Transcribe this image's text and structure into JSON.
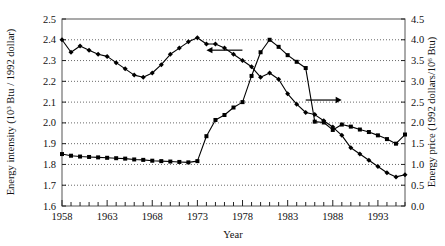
{
  "chart_data": {
    "type": "line",
    "title": "",
    "xlabel": "Year",
    "ylabel": "Energy intensity (10^3 Btu / 1992 dollar)",
    "y2label": "Energy price (1992 dollars/10^6 Btu)",
    "xlim": [
      1958,
      1996
    ],
    "ylim": [
      1.6,
      2.5
    ],
    "y2lim": [
      0.0,
      4.5
    ],
    "grid": true,
    "legend": "none",
    "x_tick_labels": [
      "1958",
      "1963",
      "1968",
      "1973",
      "1978",
      "1983",
      "1988",
      "1993"
    ],
    "x_tick_values": [
      1958,
      1963,
      1968,
      1973,
      1978,
      1983,
      1988,
      1993
    ],
    "x_minor_tick_step": 1,
    "y_tick_labels": [
      "1.6",
      "1.7",
      "1.8",
      "1.9",
      "2.0",
      "2.1",
      "2.2",
      "2.3",
      "2.4",
      "2.5"
    ],
    "y_tick_values": [
      1.6,
      1.7,
      1.8,
      1.9,
      2.0,
      2.1,
      2.2,
      2.3,
      2.4,
      2.5
    ],
    "y2_tick_labels": [
      "0.0",
      "0.5",
      "1.0",
      "1.5",
      "2.0",
      "2.5",
      "3.0",
      "3.5",
      "4.0",
      "4.5"
    ],
    "y2_tick_values": [
      0.0,
      0.5,
      1.0,
      1.5,
      2.0,
      2.5,
      3.0,
      3.5,
      4.0,
      4.5
    ],
    "x": [
      1958,
      1959,
      1960,
      1961,
      1962,
      1963,
      1964,
      1965,
      1966,
      1967,
      1968,
      1969,
      1970,
      1971,
      1972,
      1973,
      1974,
      1975,
      1976,
      1977,
      1978,
      1979,
      1980,
      1981,
      1982,
      1983,
      1984,
      1985,
      1986,
      1987,
      1988,
      1989,
      1990,
      1991,
      1992,
      1993,
      1994,
      1995,
      1996
    ],
    "series": [
      {
        "name": "Energy intensity",
        "axis": "left",
        "units": "10^3 Btu / 1992 dollar",
        "marker": "filled-diamond",
        "color": "#000000",
        "values": [
          2.4,
          2.34,
          2.37,
          2.35,
          2.33,
          2.32,
          2.29,
          2.26,
          2.23,
          2.22,
          2.24,
          2.28,
          2.33,
          2.36,
          2.39,
          2.41,
          2.38,
          2.38,
          2.36,
          2.33,
          2.3,
          2.27,
          2.22,
          2.24,
          2.21,
          2.14,
          2.09,
          2.05,
          2.04,
          2.01,
          1.98,
          1.94,
          1.88,
          1.85,
          1.82,
          1.79,
          1.76,
          1.74,
          1.75
        ]
      },
      {
        "name": "Energy price",
        "axis": "right",
        "units": "1992 dollars/10^6 Btu",
        "marker": "filled-square",
        "color": "#000000",
        "values": [
          1.25,
          1.21,
          1.19,
          1.18,
          1.17,
          1.16,
          1.15,
          1.14,
          1.12,
          1.11,
          1.09,
          1.08,
          1.07,
          1.06,
          1.05,
          1.08,
          1.68,
          2.07,
          2.19,
          2.37,
          2.5,
          3.13,
          3.7,
          4.0,
          3.83,
          3.63,
          3.47,
          3.32,
          2.03,
          2.01,
          1.83,
          1.96,
          1.91,
          1.84,
          1.78,
          1.7,
          1.61,
          1.5,
          1.72
        ]
      }
    ],
    "annotations": [
      {
        "type": "arrow",
        "direction": "left",
        "at_year": 1974,
        "at_value_left": 2.35,
        "points_to": "left-axis"
      },
      {
        "type": "arrow",
        "direction": "right",
        "at_year": 1985,
        "at_value_right": 2.55,
        "points_to": "right-axis"
      }
    ]
  }
}
